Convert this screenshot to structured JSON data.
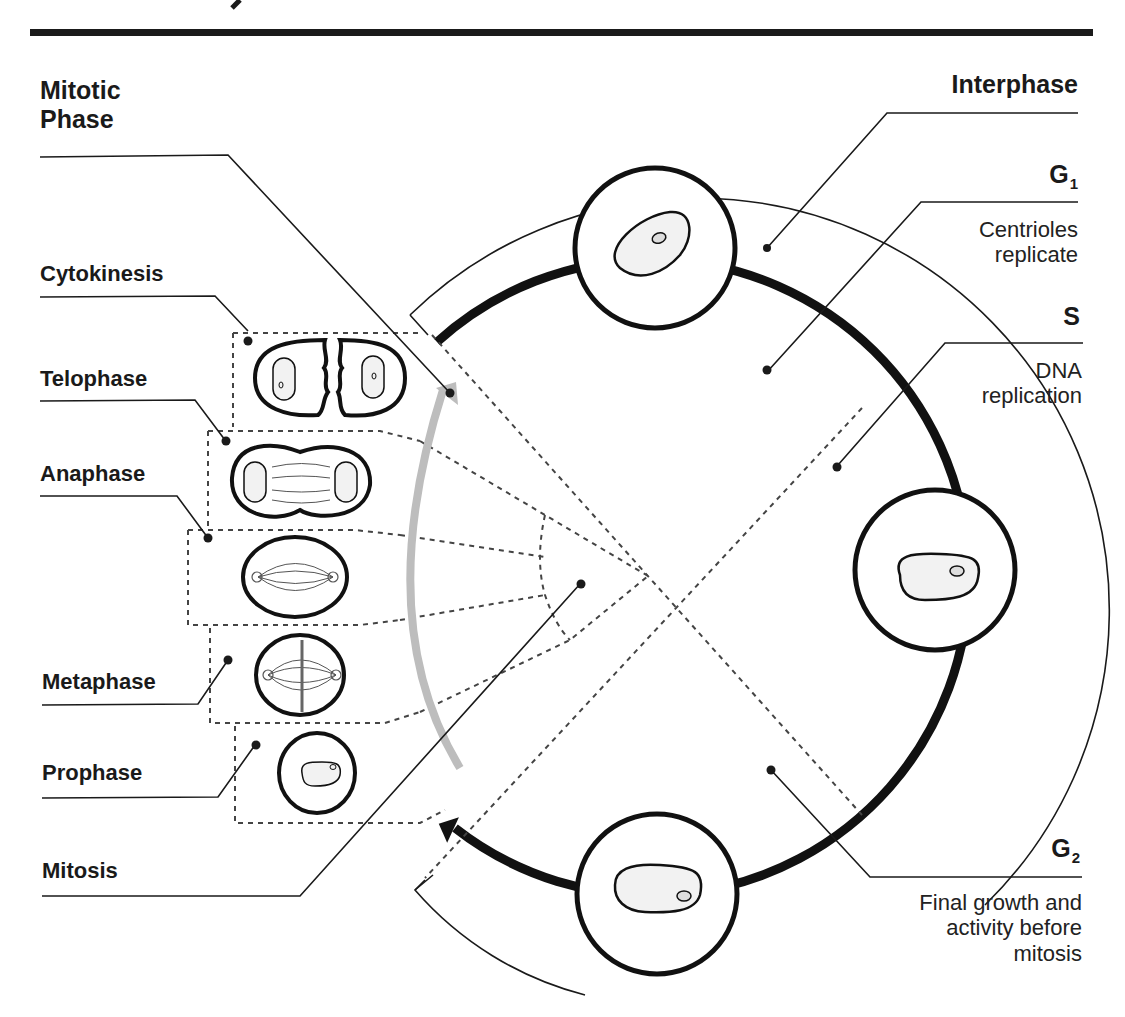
{
  "header": {
    "title_visible_fragment": "y"
  },
  "left": {
    "mitotic_phase_label": [
      "Mitotic",
      "Phase"
    ],
    "stages": [
      {
        "id": "cytokinesis",
        "label": "Cytokinesis"
      },
      {
        "id": "telophase",
        "label": "Telophase"
      },
      {
        "id": "anaphase",
        "label": "Anaphase"
      },
      {
        "id": "metaphase",
        "label": "Metaphase"
      },
      {
        "id": "prophase",
        "label": "Prophase"
      }
    ],
    "mitosis_label": "Mitosis"
  },
  "right": {
    "interphase_label": "Interphase",
    "g1": {
      "letter": "G",
      "subscript": "1",
      "description": [
        "Centrioles",
        "replicate"
      ]
    },
    "s": {
      "letter": "S",
      "description": [
        "DNA",
        "replication"
      ]
    },
    "g2": {
      "letter": "G",
      "subscript": "2",
      "description": [
        "Final growth and",
        "activity before",
        "mitosis"
      ]
    }
  },
  "colors": {
    "ink": "#1a1a1a",
    "gray_arrow": "#bdbdbd",
    "nucleus_fill": "#f2f2f2",
    "dashed": "#444444"
  }
}
